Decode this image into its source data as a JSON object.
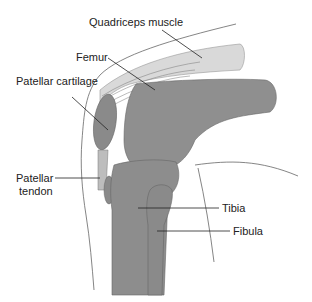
{
  "diagram": {
    "labels": {
      "quadriceps": "Quadriceps muscle",
      "femur": "Femur",
      "patellar_cartilage": "Patellar cartilage",
      "patellar_tendon_line1": "Patellar",
      "patellar_tendon_line2": "tendon",
      "tibia": "Tibia",
      "fibula": "Fibula"
    },
    "colors": {
      "quadriceps": "#d9d9d9",
      "femur": "#8f8f8f",
      "patella": "#8a8a8a",
      "tibia": "#8d8d8d",
      "fibula": "#8a8a8a",
      "outline": "#555555",
      "leader_line": "#222222"
    }
  }
}
